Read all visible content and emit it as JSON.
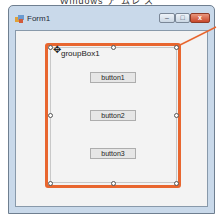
{
  "page_fragment": {
    "text": "Windows ア   ムレ ス"
  },
  "window": {
    "title": "Form1",
    "icon": "winforms-app-icon",
    "controls": {
      "minimize": "–",
      "maximize": "□",
      "close": "x"
    }
  },
  "designer": {
    "groupbox": {
      "label": "groupBox1",
      "selected": true
    },
    "buttons": [
      {
        "label": "button1"
      },
      {
        "label": "button2"
      },
      {
        "label": "button3"
      }
    ]
  },
  "colors": {
    "highlight": "#e8662f",
    "window_frame": "#c9d9ea",
    "client_bg": "#f3f3f3",
    "close_button": "#c9462a"
  }
}
